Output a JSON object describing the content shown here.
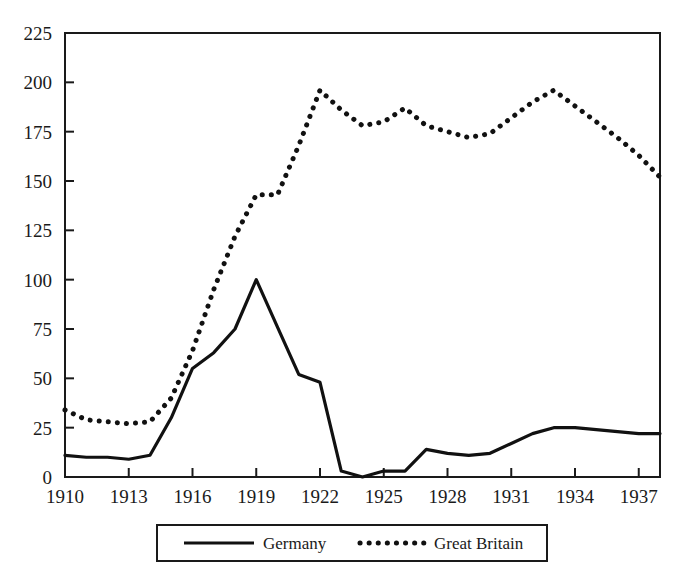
{
  "chart_data": {
    "type": "line",
    "title": "",
    "subtitle": "",
    "xlabel": "",
    "ylabel": "",
    "xlim": [
      1910,
      1938
    ],
    "ylim": [
      0,
      225
    ],
    "grid": false,
    "legend_position": "bottom-center",
    "y_ticks": [
      0,
      25,
      50,
      75,
      100,
      125,
      150,
      175,
      200,
      225
    ],
    "y_tick_labels": [
      "0",
      "25",
      "50",
      "75",
      "100",
      "125",
      "150",
      "175",
      "200",
      "225"
    ],
    "x_ticks": [
      1910,
      1913,
      1916,
      1919,
      1922,
      1925,
      1928,
      1931,
      1934,
      1937
    ],
    "x_tick_labels": [
      "1910",
      "1913",
      "1916",
      "1919",
      "1922",
      "1925",
      "1928",
      "1931",
      "1934",
      "1937"
    ],
    "x": [
      1910,
      1911,
      1912,
      1913,
      1914,
      1915,
      1916,
      1917,
      1918,
      1919,
      1920,
      1921,
      1922,
      1923,
      1924,
      1925,
      1926,
      1927,
      1928,
      1929,
      1930,
      1931,
      1932,
      1933,
      1934,
      1935,
      1936,
      1937,
      1938
    ],
    "series": [
      {
        "name": "Germany",
        "style": "solid",
        "color": "#111111",
        "values": [
          11,
          10,
          10,
          9,
          11,
          30,
          55,
          63,
          75,
          100,
          76,
          52,
          48,
          3,
          0,
          3,
          3,
          14,
          12,
          11,
          12,
          17,
          22,
          25,
          25,
          24,
          23,
          22,
          22
        ]
      },
      {
        "name": "Great Britain",
        "style": "dotted",
        "color": "#111111",
        "values": [
          34,
          29,
          28,
          27,
          28,
          40,
          64,
          95,
          122,
          143,
          143,
          168,
          196,
          186,
          178,
          180,
          187,
          178,
          175,
          172,
          174,
          182,
          190,
          196,
          188,
          180,
          172,
          163,
          152
        ]
      }
    ]
  },
  "legend": {
    "items": [
      {
        "label": "Germany",
        "style": "solid"
      },
      {
        "label": "Great Britain",
        "style": "dotted"
      }
    ]
  }
}
